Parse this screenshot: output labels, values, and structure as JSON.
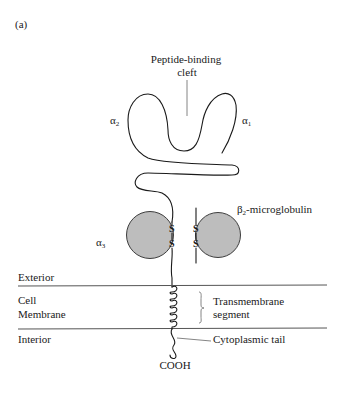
{
  "figure": {
    "panel_label": "(a)",
    "colors": {
      "domain_fill": "#bdbdbd",
      "line": "#1a1a1a",
      "membrane_line": "#555555",
      "background": "#ffffff"
    }
  },
  "labels": {
    "cleft_line1": "Peptide-binding",
    "cleft_line2": "cleft",
    "alpha2": {
      "symbol": "α",
      "sub": "2"
    },
    "alpha1": {
      "symbol": "α",
      "sub": "1"
    },
    "alpha3": {
      "symbol": "α",
      "sub": "3"
    },
    "beta2m": {
      "symbol": "β",
      "sub": "2",
      "rest": "-microglobulin"
    },
    "disulfide": "S",
    "exterior": "Exterior",
    "membrane_line1": "Cell",
    "membrane_line2": "Membrane",
    "interior": "Interior",
    "transmembrane_line1": "Transmembrane",
    "transmembrane_line2": "segment",
    "cytoplasmic_tail": "Cytoplasmic tail",
    "cooh": "COOH"
  }
}
